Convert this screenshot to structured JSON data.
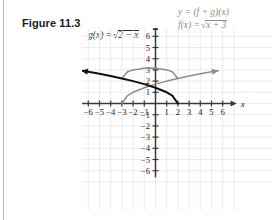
{
  "figure": {
    "label": "Figure 11.3"
  },
  "equations": {
    "g": {
      "lhs": "g(x) =",
      "radicand": "2 − x",
      "full": "g(x) = √(2 − x)"
    },
    "sum": {
      "text": "y = (f + g)(x)"
    },
    "f": {
      "lhs": "f(x) =",
      "radicand": "x + 3",
      "full": "f(x) = √(x + 3)"
    }
  },
  "axes": {
    "x_label": "x",
    "y_label": "y",
    "x_ticks": [
      "−6",
      "−5",
      "−4",
      "−3",
      "−2",
      "−1",
      "1",
      "2",
      "3",
      "4",
      "5",
      "6"
    ],
    "y_ticks": [
      "6",
      "5",
      "4",
      "3",
      "2",
      "1",
      "−1",
      "−2",
      "−3",
      "−4",
      "−5",
      "−6"
    ],
    "xlim": [
      -6.6,
      6.6
    ],
    "ylim": [
      -6.6,
      6.6
    ],
    "grid": true
  },
  "colors": {
    "curve_g": "#111111",
    "curve_f": "#8d8d8d",
    "curve_sum": "#8d8d8d",
    "axis": "#3a3a3a",
    "grid": "#e8e8ee",
    "text": "#1a1a1a",
    "rule": "#b9b9b9"
  },
  "chart_data": {
    "type": "line",
    "title": "Figure 11.3",
    "xlabel": "x",
    "ylabel": "y",
    "xlim": [
      -6.6,
      6.6
    ],
    "ylim": [
      -6.6,
      6.6
    ],
    "grid": true,
    "legend": "inline-labels",
    "series": [
      {
        "name": "g(x) = √(2 − x)",
        "color": "#111111",
        "domain": [
          -6.6,
          2
        ],
        "arrow_end": "left",
        "points": [
          {
            "x": 2,
            "y": 0
          },
          {
            "x": 1.5,
            "y": 0.71
          },
          {
            "x": 1,
            "y": 1.0
          },
          {
            "x": 0,
            "y": 1.41
          },
          {
            "x": -1,
            "y": 1.73
          },
          {
            "x": -2,
            "y": 2.0
          },
          {
            "x": -3,
            "y": 2.24
          },
          {
            "x": -4,
            "y": 2.45
          },
          {
            "x": -5,
            "y": 2.65
          },
          {
            "x": -6,
            "y": 2.83
          },
          {
            "x": -6.6,
            "y": 2.93
          }
        ]
      },
      {
        "name": "f(x) = √(x + 3)",
        "color": "#8d8d8d",
        "domain": [
          -3,
          5.6
        ],
        "arrow_end": "right",
        "points": [
          {
            "x": -3,
            "y": 0
          },
          {
            "x": -2.5,
            "y": 0.71
          },
          {
            "x": -2,
            "y": 1.0
          },
          {
            "x": -1,
            "y": 1.41
          },
          {
            "x": 0,
            "y": 1.73
          },
          {
            "x": 1,
            "y": 2.0
          },
          {
            "x": 2,
            "y": 2.24
          },
          {
            "x": 3,
            "y": 2.45
          },
          {
            "x": 4,
            "y": 2.65
          },
          {
            "x": 5,
            "y": 2.83
          },
          {
            "x": 5.6,
            "y": 2.93
          }
        ]
      },
      {
        "name": "y = (f + g)(x)",
        "color": "#8d8d8d",
        "domain": [
          -3,
          2
        ],
        "arrow_end": "none",
        "points": [
          {
            "x": -3,
            "y": 2.24
          },
          {
            "x": -2.5,
            "y": 2.83
          },
          {
            "x": -2,
            "y": 3.0
          },
          {
            "x": -1,
            "y": 3.14
          },
          {
            "x": -0.5,
            "y": 3.16
          },
          {
            "x": 0,
            "y": 3.15
          },
          {
            "x": 0.5,
            "y": 3.09
          },
          {
            "x": 1,
            "y": 3.0
          },
          {
            "x": 1.5,
            "y": 2.83
          },
          {
            "x": 2,
            "y": 2.24
          }
        ]
      }
    ]
  }
}
